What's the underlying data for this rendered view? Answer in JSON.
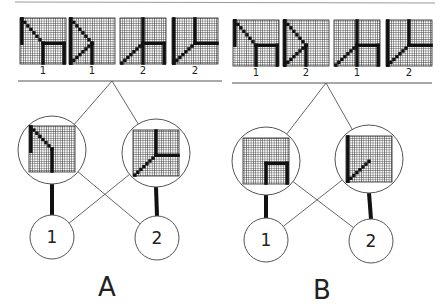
{
  "figure": {
    "panels": [
      {
        "id": "A",
        "label": "A",
        "label_pos": [
          107,
          296
        ],
        "baseline": {
          "x1": 18,
          "x2": 222,
          "y": 81
        },
        "apex": [
          112,
          81
        ],
        "training_tiles": [
          {
            "pattern": "hook-box",
            "x": 20,
            "y": 18,
            "size": 46,
            "label": "1"
          },
          {
            "pattern": "triangle",
            "x": 69,
            "y": 18,
            "size": 46,
            "label": "1"
          },
          {
            "pattern": "diag-cross-box",
            "x": 120,
            "y": 18,
            "size": 46,
            "label": "2"
          },
          {
            "pattern": "l-diag",
            "x": 172,
            "y": 18,
            "size": 46,
            "label": "2"
          }
        ],
        "hidden_units": [
          {
            "cx": 52,
            "cy": 150,
            "r": 34,
            "pattern": "hook-left",
            "tile": [
              29,
              126,
              46
            ]
          },
          {
            "cx": 156,
            "cy": 153,
            "r": 34,
            "pattern": "diag-t",
            "tile": [
              133,
              130,
              46
            ]
          }
        ],
        "output_units": [
          {
            "cx": 52,
            "cy": 237,
            "r": 22,
            "label": "1"
          },
          {
            "cx": 157,
            "cy": 238,
            "r": 22,
            "label": "2"
          }
        ]
      },
      {
        "id": "B",
        "label": "B",
        "label_pos": [
          322,
          299
        ],
        "baseline": {
          "x1": 232,
          "x2": 432,
          "y": 83
        },
        "apex": [
          326,
          83
        ],
        "training_tiles": [
          {
            "pattern": "hook-box",
            "x": 233,
            "y": 20,
            "size": 46,
            "label": "1"
          },
          {
            "pattern": "triangle",
            "x": 283,
            "y": 20,
            "size": 46,
            "label": "2"
          },
          {
            "pattern": "diag-cross-box",
            "x": 334,
            "y": 20,
            "size": 46,
            "label": "1"
          },
          {
            "pattern": "l-diag",
            "x": 386,
            "y": 20,
            "size": 46,
            "label": "2"
          }
        ],
        "hidden_units": [
          {
            "cx": 266,
            "cy": 161,
            "r": 34,
            "pattern": "box-corner",
            "tile": [
              243,
              138,
              46
            ]
          },
          {
            "cx": 369,
            "cy": 159,
            "r": 34,
            "pattern": "left-diag",
            "tile": [
              346,
              136,
              46
            ]
          }
        ],
        "output_units": [
          {
            "cx": 266,
            "cy": 240,
            "r": 22,
            "label": "1"
          },
          {
            "cx": 371,
            "cy": 241,
            "r": 22,
            "label": "2"
          }
        ]
      }
    ],
    "colors": {
      "line": "#555555",
      "ink": "#111111",
      "grid": "#3a3a3a",
      "grid_bg": "#ffffff"
    }
  }
}
